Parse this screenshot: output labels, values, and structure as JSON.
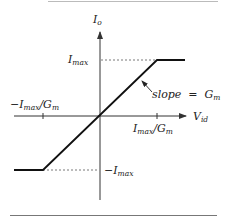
{
  "figure": {
    "type": "transfer-characteristic",
    "colors": {
      "axis": "#333333",
      "curve": "#111111",
      "dashed": "#555555",
      "text": "#222222",
      "rule": "#777777"
    },
    "axes": {
      "y_label": {
        "main": "I",
        "sub": "o"
      },
      "x_label": {
        "main": "V",
        "sub": "id"
      }
    },
    "labels": {
      "imax": {
        "main": "I",
        "sub": "max"
      },
      "neg_imax": {
        "prefix": "−",
        "main": "I",
        "sub": "max"
      },
      "pos_x_tick": {
        "main": "I",
        "sub": "max",
        "mid": "/G",
        "sub2": "m"
      },
      "neg_x_tick": {
        "prefix": "−",
        "main": "I",
        "sub": "max",
        "mid": "/G",
        "sub2": "m"
      },
      "slope": {
        "text": "slope  =  G",
        "sub": "m"
      }
    },
    "curve_points": [
      [
        14,
        170
      ],
      [
        43,
        170
      ],
      [
        157,
        60
      ],
      [
        185,
        60
      ]
    ]
  }
}
